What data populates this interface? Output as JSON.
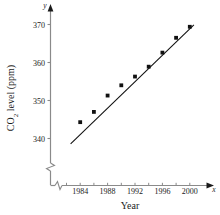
{
  "chart_data": {
    "type": "scatter",
    "title": "",
    "xlabel": "Year",
    "ylabel": "CO2 level (ppm)",
    "ylabel_parts": {
      "pre": "CO",
      "sub": "2",
      "post": " level (ppm)"
    },
    "x_axis_name": "x",
    "y_axis_name": "y",
    "xlim": [
      1982,
      2001
    ],
    "ylim": [
      337,
      372
    ],
    "grid": false,
    "legend": null,
    "axis_break_x": true,
    "axis_break_y": true,
    "xticks": [
      1984,
      1988,
      1992,
      1996,
      2000
    ],
    "xtick_labels": [
      "1984",
      "1988",
      "1992",
      "1996",
      "2000"
    ],
    "yticks": [
      340,
      350,
      360,
      370
    ],
    "ytick_labels": [
      "340",
      "350",
      "360",
      "370"
    ],
    "x": [
      1984,
      1986,
      1988,
      1990,
      1992,
      1994,
      1996,
      1998,
      2000
    ],
    "series": [
      {
        "name": "CO2 level",
        "marker": "square",
        "color": "#111111",
        "x": [
          1984,
          1986,
          1988,
          1990,
          1992,
          1994,
          1996,
          1998,
          2000
        ],
        "values": [
          344.3,
          347.0,
          351.3,
          354.0,
          356.3,
          358.9,
          362.6,
          366.5,
          369.4
        ]
      }
    ],
    "trendline": {
      "name": "least-squares fit",
      "color": "#111111",
      "x_start": 1982.6,
      "y_start": 338.6,
      "x_end": 2000.6,
      "y_end": 369.9
    }
  }
}
